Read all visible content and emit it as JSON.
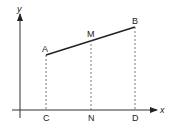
{
  "diagram": {
    "axes": {
      "x_label": "x",
      "y_label": "y"
    },
    "points": {
      "A": {
        "label": "A",
        "x": 46,
        "y": 55
      },
      "M": {
        "label": "M",
        "x": 91,
        "y": 40
      },
      "B": {
        "label": "B",
        "x": 135,
        "y": 27
      }
    },
    "feet": {
      "C": {
        "label": "C",
        "x": 46
      },
      "N": {
        "label": "N",
        "x": 91
      },
      "D": {
        "label": "D",
        "x": 135
      }
    },
    "colors": {
      "line": "#222222",
      "dash": "#555555"
    }
  }
}
